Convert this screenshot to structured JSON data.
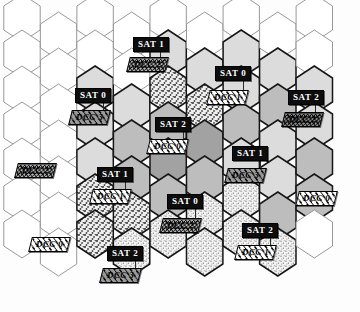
{
  "figure": {
    "kind": "hexagonal-cellular-coverage-map",
    "grid": {
      "hex_orientation": "pointy-top",
      "hex_width": 42,
      "hex_height": 48,
      "columns": 9,
      "rows": 7
    },
    "fill_legend": {
      "white": "#ffffff",
      "light_gray": "#d9d9d9",
      "mid_gray": "#b8b8b8",
      "dark_gray": "#9a9a9a",
      "coarse_stipple": "#cfcfcf",
      "fine_stipple": "#e2e2e2"
    }
  },
  "labels": [
    {
      "id": "l1",
      "sat": "SAT 1",
      "dcc": "DCC 2",
      "sat_x": 133,
      "sat_y": 37,
      "dcc_x": 128,
      "dcc_y": 57,
      "dcc_fill": "f-cross",
      "leader_x": 160,
      "leader_y": 48,
      "leader_h": 10
    },
    {
      "id": "l2",
      "sat": "SAT 0",
      "dcc": "DCC 3",
      "sat_x": 75,
      "sat_y": 88,
      "dcc_x": 70,
      "dcc_y": 110,
      "dcc_fill": "f-hatch-gray",
      "leader_x": 103,
      "leader_y": 99,
      "leader_h": 12
    },
    {
      "id": "l3",
      "sat": "SAT 0",
      "dcc": "DCC 1",
      "sat_x": 215,
      "sat_y": 66,
      "dcc_x": 208,
      "dcc_y": 90,
      "dcc_fill": "f-hatch",
      "leader_x": 243,
      "leader_y": 77,
      "leader_h": 14
    },
    {
      "id": "l4",
      "sat": "SAT 2",
      "dcc": "DCC 2",
      "sat_x": 288,
      "sat_y": 90,
      "dcc_x": 283,
      "dcc_y": 112,
      "dcc_fill": "f-cross-dk",
      "leader_x": 315,
      "leader_y": 101,
      "leader_h": 12
    },
    {
      "id": "l5",
      "sat": "SAT 2",
      "dcc": "DCC 0",
      "sat_x": 155,
      "sat_y": 117,
      "dcc_x": 148,
      "dcc_y": 139,
      "dcc_fill": "f-hatch",
      "leader_x": 183,
      "leader_y": 128,
      "leader_h": 12
    },
    {
      "id": "l6",
      "sat": "SAT 1",
      "dcc": "DCC 3",
      "sat_x": 232,
      "sat_y": 146,
      "dcc_x": 226,
      "dcc_y": 168,
      "dcc_fill": "f-hatch-gray",
      "leader_x": 260,
      "leader_y": 157,
      "leader_h": 12
    },
    {
      "id": "l7",
      "sat": "SAT 1",
      "dcc": "DCC 1",
      "sat_x": 97,
      "sat_y": 167,
      "dcc_x": 91,
      "dcc_y": 189,
      "dcc_fill": "f-hatch",
      "leader_x": 125,
      "leader_y": 178,
      "leader_h": 12
    },
    {
      "id": "l8",
      "sat": "SAT 0",
      "dcc": "DCC 2",
      "sat_x": 167,
      "sat_y": 194,
      "dcc_x": 161,
      "dcc_y": 218,
      "dcc_fill": "f-cross",
      "leader_x": 195,
      "leader_y": 205,
      "leader_h": 14
    },
    {
      "id": "l9",
      "sat": "SAT 2",
      "dcc": "DCC 1",
      "sat_x": 242,
      "sat_y": 223,
      "dcc_x": 236,
      "dcc_y": 245,
      "dcc_fill": "f-hatch",
      "leader_x": 270,
      "leader_y": 234,
      "leader_h": 12
    },
    {
      "id": "l10",
      "sat": "SAT 2",
      "dcc": "DCC 3",
      "sat_x": 107,
      "sat_y": 246,
      "dcc_x": 101,
      "dcc_y": 268,
      "dcc_fill": "f-hatch-gray",
      "leader_x": 135,
      "leader_y": 257,
      "leader_h": 12
    }
  ],
  "standalone_dcc": [
    {
      "id": "s1",
      "dcc": "DCC 2",
      "x": 16,
      "y": 163,
      "fill": "f-cross"
    },
    {
      "id": "s2",
      "dcc": "DCC 0",
      "x": 297,
      "y": 191,
      "fill": "f-hatch"
    },
    {
      "id": "s3",
      "dcc": "DCC 0",
      "x": 30,
      "y": 237,
      "fill": "f-hatch"
    }
  ]
}
